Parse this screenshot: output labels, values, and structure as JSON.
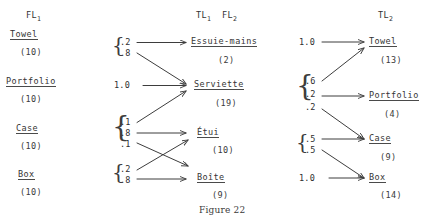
{
  "figure": {
    "caption": "Figure 22",
    "ink_color": "#3a3a3a",
    "paper_color": "#ffffff"
  },
  "columns": {
    "left": {
      "header": "FL",
      "header_sub": "1",
      "items": [
        {
          "word": "Towel",
          "count": "(10)"
        },
        {
          "word": "Portfolio",
          "count": "(10)"
        },
        {
          "word": "Case",
          "count": "(10)"
        },
        {
          "word": "Box",
          "count": "(10)"
        }
      ]
    },
    "middle": {
      "header_a": "TL",
      "header_a_sub": "1",
      "header_b": "FL",
      "header_b_sub": "2",
      "items": [
        {
          "word": "Essuie-mains",
          "count": "(2)"
        },
        {
          "word": "Serviette",
          "count": "(19)"
        },
        {
          "word": "Étui",
          "count": "(10)"
        },
        {
          "word": "Boîte",
          "count": "(9)"
        }
      ]
    },
    "right": {
      "header": "TL",
      "header_sub": "2",
      "items": [
        {
          "word": "Towel",
          "count": "(13)"
        },
        {
          "word": "Portfolio",
          "count": "(4)"
        },
        {
          "word": "Case",
          "count": "(9)"
        },
        {
          "word": "Box",
          "count": "(14)"
        }
      ]
    }
  },
  "left_groups": [
    {
      "source": "Towel",
      "brace": true,
      "probs": [
        "'.2",
        "'.8"
      ]
    },
    {
      "source": "Portfolio",
      "brace": false,
      "probs": [
        "1.0"
      ]
    },
    {
      "source": "Case",
      "brace": true,
      "probs": [
        "'.1",
        "'.8",
        "'.1"
      ]
    },
    {
      "source": "Box",
      "brace": true,
      "probs": [
        "'.2",
        "'.8"
      ]
    }
  ],
  "right_groups": [
    {
      "source": "Essuie-mains",
      "brace": false,
      "probs": [
        "1.0"
      ]
    },
    {
      "source": "Serviette",
      "brace": true,
      "probs": [
        "'.6",
        "'.2",
        "'.2"
      ]
    },
    {
      "source": "Étui",
      "brace": true,
      "probs": [
        "'.5",
        "'.5"
      ]
    },
    {
      "source": "Boîte",
      "brace": false,
      "probs": [
        "1.0"
      ]
    }
  ],
  "labels": {
    "l_towel_p1": ".2",
    "l_towel_p2": ".8",
    "l_portfolio_p1": "1.0",
    "l_case_p1": ".1",
    "l_case_p2": ".8",
    "l_case_p3": ".1",
    "l_box_p1": ".2",
    "l_box_p2": ".8",
    "r_essuie_p1": "1.0",
    "r_serviette_p1": ".6",
    "r_serviette_p2": ".2",
    "r_serviette_p3": ".2",
    "r_etui_p1": ".5",
    "r_etui_p2": ".5",
    "r_boite_p1": "1.0"
  },
  "edges_left": [
    {
      "from": "Towel",
      "prob": ".2",
      "to": "Essuie-mains"
    },
    {
      "from": "Towel",
      "prob": ".8",
      "to": "Serviette"
    },
    {
      "from": "Portfolio",
      "prob": "1.0",
      "to": "Serviette"
    },
    {
      "from": "Case",
      "prob": ".1",
      "to": "Serviette"
    },
    {
      "from": "Case",
      "prob": ".8",
      "to": "Étui"
    },
    {
      "from": "Case",
      "prob": ".1",
      "to": "Boîte"
    },
    {
      "from": "Box",
      "prob": ".2",
      "to": "Étui"
    },
    {
      "from": "Box",
      "prob": ".8",
      "to": "Boîte"
    }
  ],
  "edges_right": [
    {
      "from": "Essuie-mains",
      "prob": "1.0",
      "to": "Towel"
    },
    {
      "from": "Serviette",
      "prob": ".6",
      "to": "Towel"
    },
    {
      "from": "Serviette",
      "prob": ".2",
      "to": "Portfolio"
    },
    {
      "from": "Serviette",
      "prob": ".2",
      "to": "Case"
    },
    {
      "from": "Étui",
      "prob": ".5",
      "to": "Case"
    },
    {
      "from": "Étui",
      "prob": ".5",
      "to": "Box"
    },
    {
      "from": "Boîte",
      "prob": "1.0",
      "to": "Box"
    }
  ]
}
